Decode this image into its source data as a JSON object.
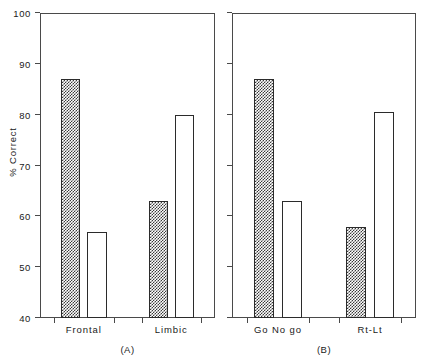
{
  "chart_data": {
    "type": "bar",
    "title": "",
    "subtitle": "",
    "xlabel": "",
    "ylabel": "% Correct",
    "ylim": [
      40,
      100
    ],
    "yticks": [
      40,
      50,
      60,
      70,
      80,
      90,
      100
    ],
    "ytick_labels": [
      "40",
      "50",
      "60",
      "70",
      "80",
      "90",
      "100"
    ],
    "grid": false,
    "legend": "none",
    "panels": [
      {
        "caption": "(A)",
        "id": "panel-a",
        "y_axis_labeled": true,
        "categories": [
          "Frontal",
          "Limbic"
        ],
        "bars": [
          {
            "group": "Frontal",
            "index": 0,
            "value": 87,
            "fill": "hatched"
          },
          {
            "group": "Frontal",
            "index": 1,
            "value": 57,
            "fill": "open"
          },
          {
            "group": "Limbic",
            "index": 0,
            "value": 63,
            "fill": "hatched"
          },
          {
            "group": "Limbic",
            "index": 1,
            "value": 80,
            "fill": "open"
          }
        ]
      },
      {
        "caption": "(B)",
        "id": "panel-b",
        "y_axis_labeled": false,
        "categories": [
          "Go No go",
          "Rt-Lt"
        ],
        "bars": [
          {
            "group": "Go No go",
            "index": 0,
            "value": 87,
            "fill": "hatched"
          },
          {
            "group": "Go No go",
            "index": 1,
            "value": 63,
            "fill": "open"
          },
          {
            "group": "Rt-Lt",
            "index": 0,
            "value": 58,
            "fill": "hatched"
          },
          {
            "group": "Rt-Lt",
            "index": 1,
            "value": 80.5,
            "fill": "open"
          }
        ]
      }
    ],
    "colors": {
      "axis": "#4a4a4a",
      "bar_outline": "#2b2b2b",
      "hatch": "#3a3a3a",
      "open_fill": "#ffffff",
      "background": "#ffffff",
      "text": "#1a1a1a"
    }
  }
}
